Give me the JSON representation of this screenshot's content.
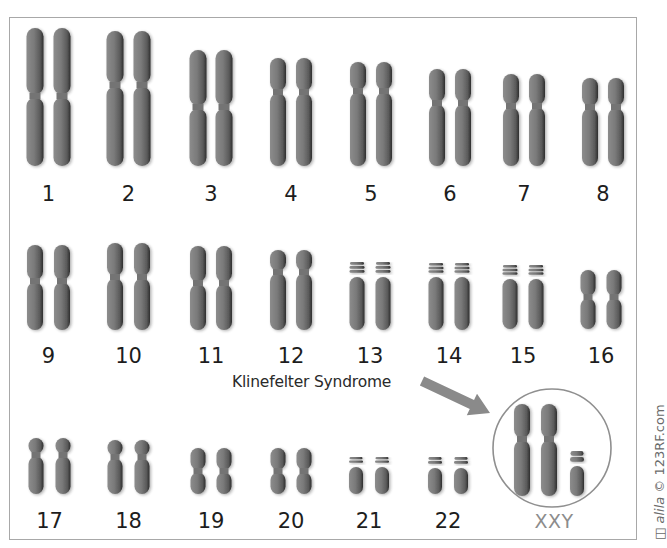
{
  "colors": {
    "chromosome": "#7d7d7d",
    "chromosome_shadow": "#3a3a3a",
    "frame": "#a8a8a8",
    "arrow": "#8a8a8a",
    "circle": "#8f8f8f",
    "label": "#1d1d1d",
    "xxy_label": "#8c8c8c"
  },
  "annotation": {
    "label": "Klinefelter Syndrome",
    "karyotype_label": "XXY"
  },
  "watermark": {
    "author": "alila",
    "text": "© 123RF.com"
  },
  "chromosomes": [
    {
      "label": "1",
      "x": [
        35,
        62
      ],
      "top": 28,
      "cen": 96,
      "bottom": 166,
      "w": 17,
      "label_y": 182,
      "bands": 0
    },
    {
      "label": "2",
      "x": [
        115,
        142
      ],
      "top": 31,
      "cen": 85,
      "bottom": 166,
      "w": 17,
      "label_y": 182,
      "bands": 0
    },
    {
      "label": "3",
      "x": [
        198,
        224
      ],
      "top": 50,
      "cen": 107,
      "bottom": 166,
      "w": 17,
      "label_y": 182,
      "bands": 0
    },
    {
      "label": "4",
      "x": [
        278,
        304
      ],
      "top": 58,
      "cen": 92,
      "bottom": 166,
      "w": 16,
      "label_y": 182,
      "bands": 0
    },
    {
      "label": "5",
      "x": [
        358,
        384
      ],
      "top": 62,
      "cen": 91,
      "bottom": 166,
      "w": 16,
      "label_y": 182,
      "bands": 0
    },
    {
      "label": "6",
      "x": [
        437,
        463
      ],
      "top": 69,
      "cen": 103,
      "bottom": 166,
      "w": 16,
      "label_y": 182,
      "bands": 0
    },
    {
      "label": "7",
      "x": [
        511,
        537
      ],
      "top": 74,
      "cen": 106,
      "bottom": 166,
      "w": 16,
      "label_y": 182,
      "bands": 0
    },
    {
      "label": "8",
      "x": [
        590,
        616
      ],
      "top": 78,
      "cen": 107,
      "bottom": 166,
      "w": 16,
      "label_y": 182,
      "bands": 0
    },
    {
      "label": "9",
      "x": [
        35,
        62
      ],
      "top": 245,
      "cen": 281,
      "bottom": 330,
      "w": 16,
      "label_y": 344,
      "bands": 0
    },
    {
      "label": "10",
      "x": [
        115,
        142
      ],
      "top": 243,
      "cen": 277,
      "bottom": 330,
      "w": 16,
      "label_y": 344,
      "bands": 0
    },
    {
      "label": "11",
      "x": [
        198,
        224
      ],
      "top": 246,
      "cen": 283,
      "bottom": 330,
      "w": 16,
      "label_y": 344,
      "bands": 0
    },
    {
      "label": "12",
      "x": [
        278,
        304
      ],
      "top": 250,
      "cen": 272,
      "bottom": 330,
      "w": 16,
      "label_y": 344,
      "bands": 0
    },
    {
      "label": "13",
      "x": [
        357,
        383
      ],
      "top": 262,
      "cen": 277,
      "bottom": 330,
      "w": 15,
      "label_y": 344,
      "bands": 2
    },
    {
      "label": "14",
      "x": [
        436,
        462
      ],
      "top": 263,
      "cen": 277,
      "bottom": 330,
      "w": 15,
      "label_y": 344,
      "bands": 2
    },
    {
      "label": "15",
      "x": [
        510,
        536
      ],
      "top": 265,
      "cen": 279,
      "bottom": 329,
      "w": 15,
      "label_y": 344,
      "bands": 2
    },
    {
      "label": "16",
      "x": [
        588,
        614
      ],
      "top": 270,
      "cen": 297,
      "bottom": 329,
      "w": 15,
      "label_y": 344,
      "bands": 0
    },
    {
      "label": "17",
      "x": [
        36,
        63
      ],
      "top": 438,
      "cen": 455,
      "bottom": 494,
      "w": 15,
      "label_y": 509,
      "bands": 0
    },
    {
      "label": "18",
      "x": [
        115,
        142
      ],
      "top": 440,
      "cen": 457,
      "bottom": 494,
      "w": 15,
      "label_y": 509,
      "bands": 0
    },
    {
      "label": "19",
      "x": [
        198,
        224
      ],
      "top": 448,
      "cen": 471,
      "bottom": 494,
      "w": 15,
      "label_y": 509,
      "bands": 0
    },
    {
      "label": "20",
      "x": [
        278,
        304
      ],
      "top": 448,
      "cen": 471,
      "bottom": 494,
      "w": 15,
      "label_y": 509,
      "bands": 0
    },
    {
      "label": "21",
      "x": [
        356,
        382
      ],
      "top": 457,
      "cen": 467,
      "bottom": 494,
      "w": 14,
      "label_y": 509,
      "bands": 1
    },
    {
      "label": "22",
      "x": [
        435,
        461
      ],
      "top": 457,
      "cen": 468,
      "bottom": 494,
      "w": 14,
      "label_y": 509,
      "bands": 1
    }
  ],
  "sex_chromosomes": [
    {
      "name": "X",
      "x": 522,
      "top": 404,
      "cen": 439,
      "bottom": 496,
      "w": 16,
      "bands": 0
    },
    {
      "name": "X",
      "x": 549,
      "top": 404,
      "cen": 439,
      "bottom": 496,
      "w": 16,
      "bands": 0
    },
    {
      "name": "Y",
      "x": 577,
      "top": 451,
      "cen": 466,
      "bottom": 496,
      "w": 14,
      "bands": 1
    }
  ],
  "highlight_circle": {
    "cx": 552,
    "cy": 448,
    "r": 59
  },
  "arrow": {
    "x1": 422,
    "y1": 381,
    "x2": 490,
    "y2": 413
  }
}
